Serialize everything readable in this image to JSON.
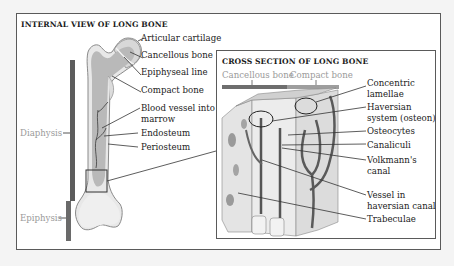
{
  "left_panel": {
    "title": "INTERNAL VIEW OF LONG BONE",
    "labels": {
      "articular_cartilage": "Articular cartilage",
      "cancellous_bone": "Cancellous bone",
      "epiphyseal_line": "Epiphyseal line",
      "compact_bone": "Compact bone",
      "blood_vessel_line1": "Blood vessel into",
      "blood_vessel_line2": "marrow",
      "endosteum": "Endosteum",
      "periosteum": "Periosteum"
    },
    "regions": {
      "diaphysis": "Diaphysis",
      "epiphysis": "Epiphysis"
    }
  },
  "right_panel": {
    "title": "CROSS SECTION OF LONG BONE",
    "bar_labels": {
      "cancellous": "Cancellous bone",
      "compact": "Compact bone"
    },
    "labels": {
      "concentric_1": "Concentric",
      "concentric_2": "lamellae",
      "haversian_1": "Haversian",
      "haversian_2": "system (osteon)",
      "osteocytes": "Osteocytes",
      "canaliculi": "Canaliculi",
      "volkmann_1": "Volkmann's",
      "volkmann_2": "canal",
      "vessel_1": "Vessel in",
      "vessel_2": "haversian canal",
      "trabeculae": "Trabeculae"
    }
  },
  "colors": {
    "region_bar": "#5c5c5c",
    "cancellous_bar": "#6e6e6e",
    "compact_bar": "#9e9e9e",
    "vessel": "#555555",
    "bone_fill": "#e6e6e6",
    "marrow_fill": "#b8b8b8"
  }
}
